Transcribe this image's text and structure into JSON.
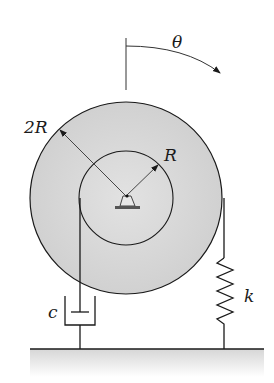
{
  "diagram": {
    "type": "mechanical-vibration-system",
    "labels": {
      "angle": "θ",
      "outer_radius": "2R",
      "inner_radius": "R",
      "damper": "c",
      "spring": "k"
    },
    "colors": {
      "disk_fill": "#d4d4d4",
      "line": "#1a1a1a",
      "ground_fill": "#d9d9d9"
    }
  }
}
